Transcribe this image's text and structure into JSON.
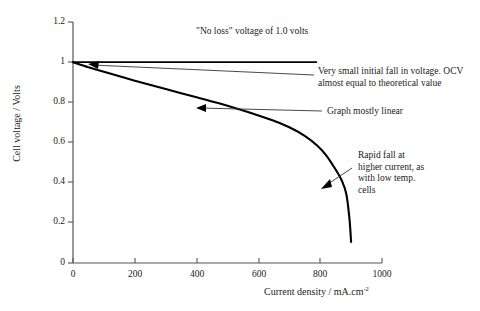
{
  "chart_data": {
    "type": "line",
    "title": "",
    "xlabel": "Current density / mA.cm",
    "xlabel_sup": "-2",
    "ylabel": "Cell voltage / Volts",
    "xlim": [
      0,
      1000
    ],
    "ylim": [
      0,
      1.2
    ],
    "xticks": [
      0,
      200,
      400,
      600,
      800,
      1000
    ],
    "yticks": [
      "0",
      "0.2",
      "0.4",
      "0.6",
      "0.8",
      "1",
      "1.2"
    ],
    "ytick_values": [
      0,
      0.2,
      0.4,
      0.6,
      0.8,
      1.0,
      1.2
    ],
    "grid": false,
    "legend": "none",
    "series": [
      {
        "name": "\"No loss\" voltage",
        "style": "solid-thin",
        "x": [
          0,
          790
        ],
        "values": [
          1.0,
          1.0
        ]
      },
      {
        "name": "Cell voltage (polarisation curve)",
        "style": "solid-thick",
        "x": [
          0,
          50,
          100,
          200,
          300,
          400,
          500,
          600,
          650,
          700,
          750,
          790,
          820,
          850,
          870,
          885,
          895,
          900
        ],
        "values": [
          1.0,
          0.975,
          0.952,
          0.908,
          0.866,
          0.825,
          0.783,
          0.735,
          0.708,
          0.676,
          0.633,
          0.585,
          0.535,
          0.465,
          0.41,
          0.34,
          0.215,
          0.105
        ]
      }
    ],
    "annotations": [
      {
        "id": "no-loss",
        "text": "\"No loss\" voltage of 1.0 volts",
        "leader": "none"
      },
      {
        "id": "initial-fall",
        "text": "Very small initial fall in voltage. OCV\nalmost equal to theoretical value",
        "leader": "arrow-left"
      },
      {
        "id": "mostly-linear",
        "text": "Graph mostly linear",
        "leader": "arrow-left"
      },
      {
        "id": "rapid-fall",
        "text": "Rapid fall at\nhigher current, as\nwith low temp.\ncells",
        "leader": "arrow-down-left"
      }
    ],
    "colors": {
      "curve": "#000000",
      "axis": "#555555",
      "leader": "#333333",
      "text": "#1a1a1a",
      "background": "#ffffff"
    }
  }
}
